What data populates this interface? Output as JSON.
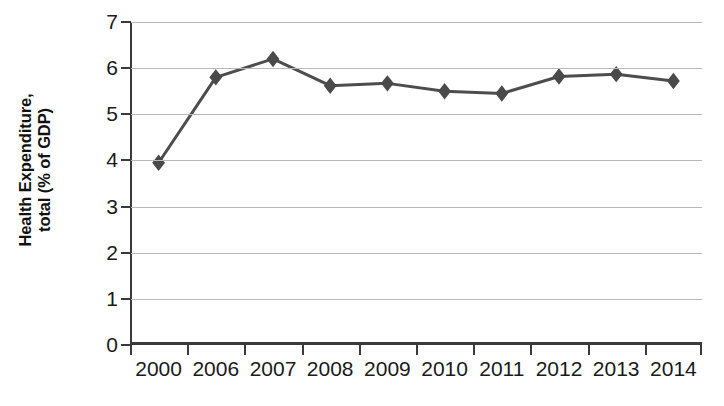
{
  "chart_data": {
    "type": "line",
    "title": "",
    "xlabel": "",
    "ylabel": "Health Expenditure, total (% of GDP)",
    "ylabel_line1": "Health Expenditure,",
    "ylabel_line2": "total (% of GDP)",
    "categories": [
      "2000",
      "2006",
      "2007",
      "2008",
      "2009",
      "2010",
      "2011",
      "2012",
      "2013",
      "2014"
    ],
    "values": [
      3.95,
      5.8,
      6.2,
      5.62,
      5.67,
      5.5,
      5.45,
      5.82,
      5.87,
      5.72
    ],
    "series": [
      {
        "name": "Health Expenditure, total (% of GDP)",
        "values": [
          3.95,
          5.8,
          6.2,
          5.62,
          5.67,
          5.5,
          5.45,
          5.82,
          5.87,
          5.72
        ]
      }
    ],
    "ylim": [
      0,
      7
    ],
    "ytick_values": [
      0,
      1,
      2,
      3,
      4,
      5,
      6,
      7
    ],
    "ytick_labels": [
      "0",
      "1",
      "2",
      "3",
      "4",
      "5",
      "6",
      "7"
    ],
    "grid": true,
    "grid_axis": "y",
    "legend": false,
    "legend_position": "none",
    "marker": "diamond",
    "line_color": "#4d4d4d",
    "marker_color": "#4a4a4a",
    "grid_color": "#b9b9b9",
    "axis_color": "#3a3a3a",
    "background_color": "#ffffff"
  }
}
